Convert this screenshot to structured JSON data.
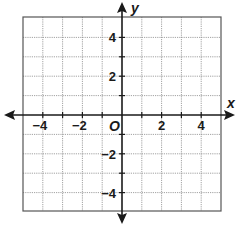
{
  "diagram": {
    "type": "coordinate-plane",
    "x_axis_label": "x",
    "y_axis_label": "y",
    "origin_label": "O",
    "x_range": [
      -5,
      5
    ],
    "y_range": [
      -5,
      5
    ],
    "grid_step": 1,
    "x_tick_labels": [
      {
        "value": -4,
        "text": "−4"
      },
      {
        "value": -2,
        "text": "−2"
      },
      {
        "value": 2,
        "text": "2"
      },
      {
        "value": 4,
        "text": "4"
      }
    ],
    "y_tick_labels": [
      {
        "value": 4,
        "text": "4"
      },
      {
        "value": 2,
        "text": "2"
      },
      {
        "value": -2,
        "text": "−2"
      },
      {
        "value": -4,
        "text": "−4"
      }
    ],
    "colors": {
      "axis": "#1a1a1a",
      "grid_line": "#8a8a8a",
      "border": "#555555",
      "background": "#ffffff"
    }
  }
}
